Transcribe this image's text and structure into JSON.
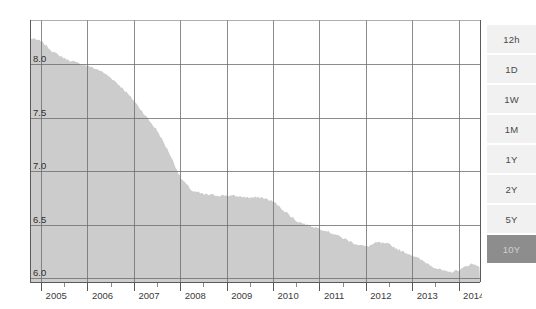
{
  "chart_data": {
    "type": "area",
    "title": "",
    "subtitle": "",
    "xlabel": "",
    "ylabel": "",
    "x": [
      2004.75,
      2005.0,
      2005.25,
      2005.5,
      2005.75,
      2006.0,
      2006.25,
      2006.5,
      2006.75,
      2007.0,
      2007.25,
      2007.5,
      2007.75,
      2008.0,
      2008.25,
      2008.5,
      2008.75,
      2009.0,
      2009.25,
      2009.5,
      2009.75,
      2010.0,
      2010.25,
      2010.5,
      2010.75,
      2011.0,
      2011.25,
      2011.5,
      2011.75,
      2012.0,
      2012.25,
      2012.5,
      2012.75,
      2013.0,
      2013.25,
      2013.5,
      2013.75,
      2014.0,
      2014.25,
      2014.45
    ],
    "values": [
      8.25,
      8.22,
      8.12,
      8.06,
      8.02,
      7.99,
      7.95,
      7.88,
      7.78,
      7.66,
      7.52,
      7.38,
      7.18,
      6.94,
      6.82,
      6.79,
      6.78,
      6.78,
      6.77,
      6.76,
      6.76,
      6.72,
      6.63,
      6.54,
      6.5,
      6.47,
      6.43,
      6.38,
      6.33,
      6.3,
      6.34,
      6.32,
      6.26,
      6.22,
      6.16,
      6.1,
      6.06,
      6.08,
      6.14,
      6.12
    ],
    "xlim": [
      2004.75,
      2014.45
    ],
    "ylim": [
      5.97,
      8.42
    ],
    "yticks": [
      "6.0",
      "6.5",
      "7.0",
      "7.5",
      "8.0"
    ],
    "ytick_values": [
      6.0,
      6.5,
      7.0,
      7.5,
      8.0
    ],
    "xticks": [
      "2005",
      "2006",
      "2007",
      "2008",
      "2009",
      "2010",
      "2011",
      "2012",
      "2013",
      "2014"
    ],
    "xtick_values": [
      2005,
      2006,
      2007,
      2008,
      2009,
      2010,
      2011,
      2012,
      2013,
      2014
    ],
    "minor_xtick_values": [
      2005.5,
      2006.5,
      2007.5,
      2008.5,
      2009.5,
      2010.5,
      2011.5,
      2012.5,
      2013.5,
      2014.5
    ],
    "grid": true,
    "legend": null,
    "fill_color": "#cccccc",
    "grid_color": "#6e6e6e",
    "axis_color": "#5a5a5a",
    "plot_background": "#ffffff"
  },
  "range_selector": {
    "name": "time-range-selector",
    "selected": "10Y",
    "options": [
      {
        "label": "12h",
        "active": false
      },
      {
        "label": "1D",
        "active": false
      },
      {
        "label": "1W",
        "active": false
      },
      {
        "label": "1M",
        "active": false
      },
      {
        "label": "1Y",
        "active": false
      },
      {
        "label": "2Y",
        "active": false
      },
      {
        "label": "5Y",
        "active": false
      },
      {
        "label": "10Y",
        "active": true
      }
    ],
    "colors": {
      "button_background": "#f1f1f1",
      "button_text": "#4a4a4a",
      "active_background": "#8d8d8d",
      "active_text": "#cfcfcf"
    }
  }
}
